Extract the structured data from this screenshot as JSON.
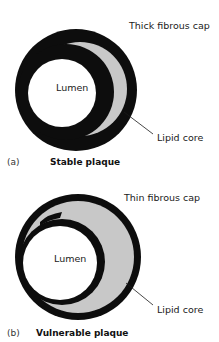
{
  "colors": {
    "wall": "#0d0d0d",
    "lipid": "#c8c8c8",
    "lumen": "#ffffff",
    "text": "#1a1a1a"
  },
  "panels": [
    {
      "tag": "(a)",
      "title": "Stable plaque",
      "labels": {
        "cap": "Thick fibrous cap",
        "lumen": "Lumen",
        "core": "Lipid core"
      }
    },
    {
      "tag": "(b)",
      "title": "Vulnerable plaque",
      "labels": {
        "cap": "Thin fibrous cap",
        "lumen": "Lumen",
        "core": "Lipid core"
      }
    }
  ]
}
